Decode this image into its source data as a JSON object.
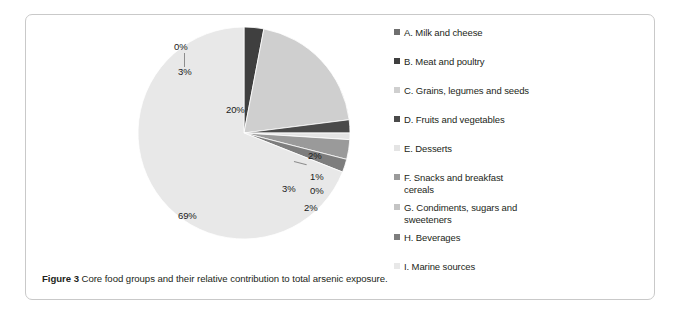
{
  "figure": {
    "caption_label": "Figure 3",
    "caption_text": "Core food groups and their relative contribution to total arsenic exposure."
  },
  "chart_data": {
    "type": "pie",
    "title": "",
    "subtitle": "",
    "xlabel": "",
    "ylabel": "",
    "grid": false,
    "legend_position": "right",
    "units": "percent",
    "start_angle_deg": 0,
    "direction": "clockwise",
    "categories": [
      "A. Milk and cheese",
      "B. Meat and poultry",
      "C. Grains, legumes and seeds",
      "D. Fruits and vegetables",
      "E. Desserts",
      "F. Snacks and breakfast cereals",
      "G. Condiments, sugars and sweeteners",
      "H. Beverages",
      "I. Marine sources"
    ],
    "values": [
      0,
      3,
      20,
      2,
      1,
      3,
      0,
      2,
      69
    ],
    "data_labels": [
      "0%",
      "3%",
      "20%",
      "2%",
      "1%",
      "3%",
      "0%",
      "2%",
      "69%"
    ],
    "colors": [
      "#6f6f6f",
      "#3f3f3f",
      "#cfcfcf",
      "#4a4a4a",
      "#e4e4e4",
      "#9a9a9a",
      "#c4c4c4",
      "#7d7d7d",
      "#e8e8e8"
    ]
  },
  "legend": {
    "items": [
      {
        "label": "A. Milk and cheese",
        "color": "#6f6f6f"
      },
      {
        "label": "B. Meat and poultry",
        "color": "#3f3f3f"
      },
      {
        "label": "C. Grains, legumes and seeds",
        "color": "#cfcfcf"
      },
      {
        "label": "D. Fruits and vegetables",
        "color": "#4a4a4a"
      },
      {
        "label": "E. Desserts",
        "color": "#e4e4e4"
      },
      {
        "label": "F. Snacks and breakfast cereals",
        "color": "#9a9a9a"
      },
      {
        "label": "G. Condiments, sugars and sweeteners",
        "color": "#c4c4c4"
      },
      {
        "label": "H. Beverages",
        "color": "#7d7d7d"
      },
      {
        "label": "I. Marine sources",
        "color": "#e8e8e8"
      }
    ]
  }
}
